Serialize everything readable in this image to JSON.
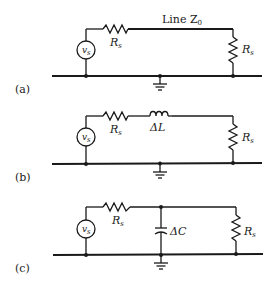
{
  "figure": {
    "panels": [
      {
        "tag": "(a)",
        "source_label": "v",
        "source_sub": "s",
        "series_resistor_label": "R",
        "series_resistor_sub": "s",
        "line_label": "Line Z",
        "line_sub": "0",
        "load_resistor_label": "R",
        "load_resistor_sub": "s"
      },
      {
        "tag": "(b)",
        "source_label": "v",
        "source_sub": "s",
        "series_resistor_label": "R",
        "series_resistor_sub": "s",
        "inductor_label": "ΔL",
        "load_resistor_label": "R",
        "load_resistor_sub": "s"
      },
      {
        "tag": "(c)",
        "source_label": "v",
        "source_sub": "s",
        "series_resistor_label": "R",
        "series_resistor_sub": "s",
        "capacitor_label": "ΔC",
        "load_resistor_label": "R",
        "load_resistor_sub": "s"
      }
    ]
  }
}
